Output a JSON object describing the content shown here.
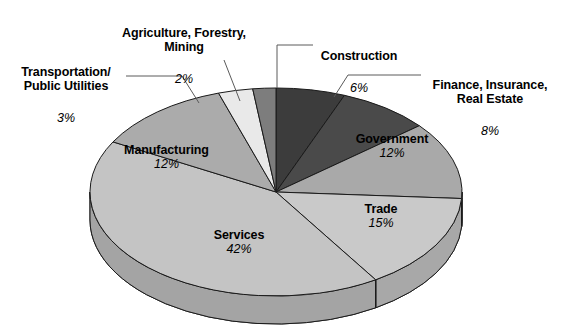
{
  "chart_data": {
    "type": "pie",
    "title": "",
    "subtitle": "",
    "xlabel": "",
    "ylabel": "",
    "legend_position": "none",
    "grid": false,
    "three_d": true,
    "start_angle_deg": 90,
    "direction": "clockwise",
    "categories": [
      "Construction",
      "Finance, Insurance, Real Estate",
      "Government",
      "Trade",
      "Services",
      "Manufacturing",
      "Transportation/Public Utilities",
      "Agriculture, Forestry, Mining"
    ],
    "values": [
      6,
      8,
      12,
      15,
      42,
      12,
      3,
      2
    ],
    "units": "percent",
    "slices": [
      {
        "name": "Construction",
        "label": "Construction",
        "percent_text": "6%",
        "value": 6,
        "color": "#3c3c3c",
        "side_color": "#2e2e2e",
        "label_style": "callout"
      },
      {
        "name": "Finance, Insurance, Real Estate",
        "label": "Finance, Insurance,\nReal Estate",
        "percent_text": "8%",
        "value": 8,
        "color": "#4a4a4a",
        "side_color": "#3a3a3a",
        "label_style": "callout"
      },
      {
        "name": "Government",
        "label": "Government",
        "percent_text": "12%",
        "value": 12,
        "color": "#a9a9a9",
        "side_color": "#8e8e8e",
        "label_style": "inside"
      },
      {
        "name": "Trade",
        "label": "Trade",
        "percent_text": "15%",
        "value": 15,
        "color": "#c9c9c9",
        "side_color": "#a8a8a8",
        "label_style": "inside"
      },
      {
        "name": "Services",
        "label": "Services",
        "percent_text": "42%",
        "value": 42,
        "color": "#c4c4c4",
        "side_color": "#a4a4a4",
        "label_style": "inside"
      },
      {
        "name": "Manufacturing",
        "label": "Manufacturing",
        "percent_text": "12%",
        "value": 12,
        "color": "#ababab",
        "side_color": "#909090",
        "label_style": "inside"
      },
      {
        "name": "Transportation/Public Utilities",
        "label": "Transportation/\nPublic Utilities",
        "percent_text": "3%",
        "value": 3,
        "color": "#e9e9e9",
        "side_color": "#c6c6c6",
        "label_style": "callout"
      },
      {
        "name": "Agriculture, Forestry, Mining",
        "label": "Agriculture, Forestry,\nMining",
        "percent_text": "2%",
        "value": 2,
        "color": "#7d7d7d",
        "side_color": "#696969",
        "label_style": "callout"
      }
    ]
  },
  "callouts": {
    "transportation": {
      "name": "Transportation/\nPublic Utilities",
      "percent": "3%"
    },
    "agriculture": {
      "name": "Agriculture, Forestry,\nMining",
      "percent": "2%"
    },
    "construction": {
      "name": "Construction",
      "percent": "6%"
    },
    "finance": {
      "name": "Finance, Insurance,\nReal Estate",
      "percent": "8%"
    }
  },
  "inside_labels": {
    "manufacturing": {
      "name": "Manufacturing",
      "percent": "12%"
    },
    "government": {
      "name": "Government",
      "percent": "12%"
    },
    "trade": {
      "name": "Trade",
      "percent": "15%"
    },
    "services": {
      "name": "Services",
      "percent": "42%"
    }
  },
  "style": {
    "background": "#ffffff",
    "outline": "#1a1a1a",
    "leader_line": "#555555"
  }
}
